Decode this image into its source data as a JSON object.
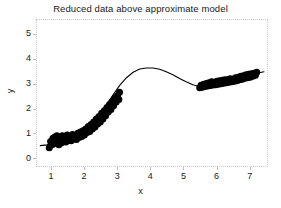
{
  "figure": {
    "background_color": "#ffffff",
    "frame_color": "#c9c9c9",
    "data_color": "#000000"
  },
  "axis": {
    "y_label": "y",
    "x_label": "x"
  },
  "chart_data": {
    "type": "scatter",
    "title": "Reduced data above approximate model",
    "xlabel": "x",
    "ylabel": "y",
    "xlim": [
      0.55,
      7.55
    ],
    "ylim": [
      -0.35,
      5.6
    ],
    "xticks": [
      1,
      2,
      3,
      4,
      5,
      6,
      7
    ],
    "yticks": [
      0,
      1,
      2,
      3,
      4,
      5
    ],
    "xtick_labels": [
      "1",
      "2",
      "3",
      "4",
      "5",
      "6",
      "7"
    ],
    "ytick_labels": [
      "0",
      "1",
      "2",
      "3",
      "4",
      "5"
    ],
    "grid": false,
    "legend": null,
    "series": [
      {
        "name": "approximate model",
        "type": "line",
        "color": "#000000",
        "linewidth": 1,
        "x": [
          0.65,
          0.85,
          1.05,
          1.25,
          1.45,
          1.65,
          1.85,
          2.05,
          2.25,
          2.45,
          2.65,
          2.85,
          3.05,
          3.25,
          3.45,
          3.65,
          3.85,
          4.05,
          4.25,
          4.45,
          4.65,
          4.85,
          5.05,
          5.25,
          5.45,
          5.65,
          5.85,
          6.05,
          6.25,
          6.45,
          6.65,
          6.85,
          7.05,
          7.25,
          7.4
        ],
        "y": [
          0.55,
          0.58,
          0.63,
          0.7,
          0.79,
          0.9,
          1.05,
          1.25,
          1.5,
          1.82,
          2.2,
          2.6,
          2.98,
          3.28,
          3.5,
          3.63,
          3.67,
          3.67,
          3.62,
          3.52,
          3.4,
          3.25,
          3.12,
          3.0,
          2.93,
          2.92,
          2.95,
          3.0,
          3.07,
          3.15,
          3.24,
          3.33,
          3.41,
          3.48,
          3.52
        ]
      },
      {
        "name": "reduced data (left cluster)",
        "type": "scatter",
        "color": "#000000",
        "marker": "filled-circle",
        "marker_size": 7,
        "x": [
          0.92,
          0.96,
          1.0,
          1.03,
          1.06,
          1.09,
          1.12,
          1.15,
          1.18,
          1.21,
          1.24,
          1.28,
          1.31,
          1.34,
          1.38,
          1.42,
          1.46,
          1.5,
          1.54,
          1.58,
          1.62,
          1.66,
          1.7,
          1.74,
          1.78,
          1.82,
          1.86,
          1.9,
          1.94,
          1.98,
          2.02,
          2.06,
          2.1,
          2.14,
          2.18,
          2.22,
          2.26,
          2.3,
          2.34,
          2.38,
          2.42,
          2.46,
          2.5,
          2.54,
          2.58,
          2.62,
          2.66,
          2.7,
          2.74,
          2.78,
          2.82,
          2.86,
          2.9,
          2.94,
          2.98,
          3.02,
          3.04
        ],
        "y": [
          0.46,
          0.72,
          0.58,
          0.85,
          0.62,
          0.9,
          0.68,
          0.95,
          0.74,
          0.58,
          0.88,
          0.66,
          0.95,
          0.72,
          0.86,
          0.7,
          0.98,
          0.78,
          0.92,
          0.75,
          1.0,
          0.82,
          0.95,
          0.8,
          1.05,
          0.88,
          1.1,
          0.92,
          1.15,
          0.98,
          1.22,
          1.08,
          1.32,
          1.12,
          1.4,
          1.22,
          1.5,
          1.3,
          1.62,
          1.42,
          1.72,
          1.5,
          1.85,
          1.62,
          1.95,
          1.75,
          2.08,
          1.9,
          2.2,
          2.0,
          2.32,
          2.15,
          2.45,
          2.3,
          2.55,
          2.4,
          2.7
        ]
      },
      {
        "name": "reduced data (right cluster)",
        "type": "scatter",
        "color": "#000000",
        "marker": "filled-circle",
        "marker_size": 7,
        "x": [
          5.46,
          5.5,
          5.54,
          5.58,
          5.62,
          5.66,
          5.7,
          5.74,
          5.78,
          5.82,
          5.86,
          5.9,
          5.94,
          5.98,
          6.02,
          6.06,
          6.1,
          6.14,
          6.18,
          6.22,
          6.26,
          6.3,
          6.34,
          6.38,
          6.42,
          6.46,
          6.5,
          6.54,
          6.58,
          6.62,
          6.66,
          6.7,
          6.74,
          6.78,
          6.82,
          6.86,
          6.9,
          6.94,
          6.98,
          7.02,
          7.06,
          7.1,
          7.14,
          7.18
        ],
        "y": [
          2.88,
          2.98,
          2.9,
          3.02,
          2.93,
          3.05,
          2.95,
          3.08,
          2.97,
          3.12,
          2.99,
          3.1,
          3.0,
          3.14,
          3.02,
          3.16,
          3.04,
          3.18,
          3.06,
          3.2,
          3.08,
          3.2,
          3.1,
          3.24,
          3.12,
          3.22,
          3.14,
          3.28,
          3.16,
          3.3,
          3.2,
          3.34,
          3.22,
          3.36,
          3.26,
          3.4,
          3.28,
          3.42,
          3.3,
          3.44,
          3.34,
          3.46,
          3.38,
          3.5
        ]
      }
    ]
  }
}
